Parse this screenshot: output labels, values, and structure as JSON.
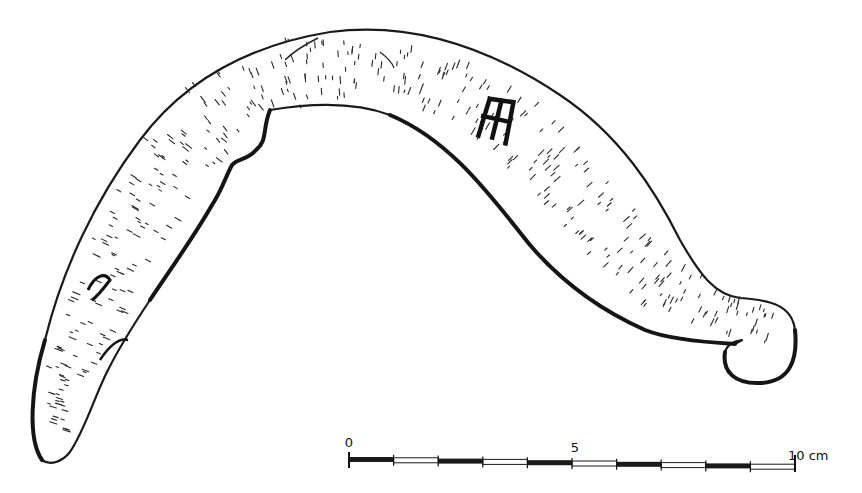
{
  "figure": {
    "maker_mark_glyph": "ladder-like mark (stamp)"
  },
  "scale_bar": {
    "labels": [
      {
        "text": "0",
        "value": 0
      },
      {
        "text": "5",
        "value": 5
      },
      {
        "text": "10 cm",
        "value": 10
      }
    ],
    "unit": "cm",
    "min": 0,
    "max": 10,
    "segments": 10,
    "segment_pattern": [
      "black",
      "white",
      "black",
      "white",
      "black",
      "white",
      "black",
      "white",
      "black",
      "white"
    ]
  },
  "colors": {
    "ink": "#1a1a1a",
    "paper": "#ffffff"
  }
}
